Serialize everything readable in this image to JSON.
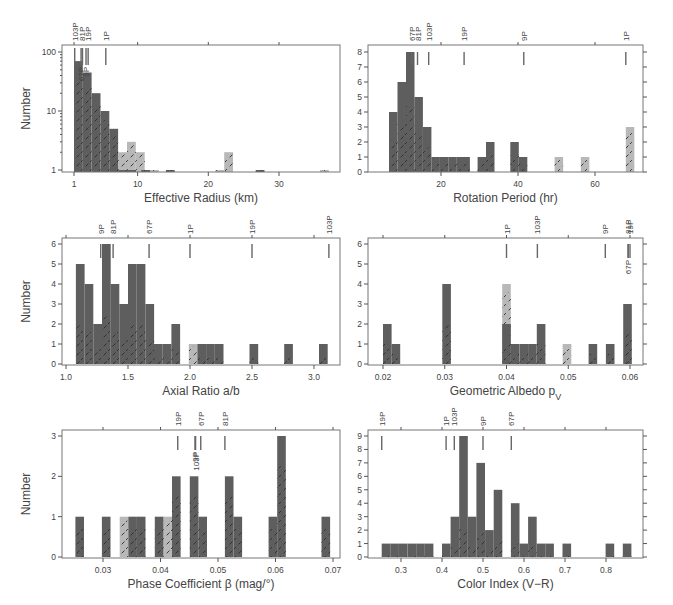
{
  "figure": {
    "ylabel": "Number",
    "colors": {
      "dark_bar": "#5e5e5e",
      "light_bar": "#b8b8b8",
      "hatch": "#333333",
      "axis": "#777777"
    }
  },
  "chart_data": [
    {
      "id": "effective-radius",
      "type": "bar",
      "title": "",
      "xlabel": "Effective Radius (km)",
      "ylabel": "Number",
      "yscale": "log",
      "ylim": [
        1,
        100
      ],
      "xlim": [
        0,
        38
      ],
      "xticks": [
        1,
        10,
        20,
        30
      ],
      "yticks": [
        1,
        10,
        100
      ],
      "bin_width": 1.25,
      "series": [
        {
          "name": "dark",
          "bins": [
            [
              1.0,
              70
            ],
            [
              2.25,
              45
            ],
            [
              3.5,
              20
            ],
            [
              4.75,
              10
            ],
            [
              6.0,
              5
            ],
            [
              7.25,
              1
            ],
            [
              8.5,
              1
            ],
            [
              10.5,
              1
            ],
            [
              14.0,
              1
            ],
            [
              26.7,
              1
            ]
          ]
        },
        {
          "name": "light",
          "bins": [
            [
              7.25,
              2
            ],
            [
              8.5,
              3
            ],
            [
              9.75,
              2
            ],
            [
              11.75,
              1
            ],
            [
              21.0,
              1
            ],
            [
              22.25,
              2
            ],
            [
              35.8,
              1
            ]
          ]
        }
      ],
      "comet_markers": [
        {
          "label": "103P",
          "x": 1.1
        },
        {
          "label": "67P",
          "x": 2.0
        },
        {
          "label": "81P",
          "x": 2.2
        },
        {
          "label": "9P",
          "x": 2.7
        },
        {
          "label": "19P",
          "x": 3.0
        },
        {
          "label": "1P",
          "x": 5.5
        }
      ]
    },
    {
      "id": "rotation-period",
      "type": "bar",
      "xlabel": "Rotation Period (hr)",
      "ylabel": "Number",
      "ylim": [
        0,
        8
      ],
      "xlim": [
        3,
        74
      ],
      "xticks": [
        20,
        40,
        60
      ],
      "yticks": [
        0,
        1,
        2,
        3,
        4,
        5,
        6,
        7,
        8
      ],
      "bin_width": 2.2,
      "series": [
        {
          "name": "dark",
          "bins": [
            [
              6.5,
              4
            ],
            [
              8.7,
              6
            ],
            [
              10.9,
              8
            ],
            [
              13.1,
              5
            ],
            [
              15.3,
              3
            ],
            [
              17.5,
              1
            ],
            [
              19.7,
              1
            ],
            [
              21.9,
              1
            ],
            [
              24.1,
              1
            ],
            [
              25.3,
              1
            ],
            [
              29.5,
              1
            ],
            [
              31.7,
              2
            ],
            [
              38.0,
              2
            ],
            [
              40.2,
              1
            ]
          ]
        },
        {
          "name": "light",
          "bins": [
            [
              49.5,
              1
            ],
            [
              56.3,
              1
            ],
            [
              68.0,
              3
            ]
          ]
        }
      ],
      "comet_markers": [
        {
          "label": "67P",
          "x": 12.4
        },
        {
          "label": "81P",
          "x": 13.9
        },
        {
          "label": "103P",
          "x": 16.8
        },
        {
          "label": "19P",
          "x": 26.0
        },
        {
          "label": "9P",
          "x": 41.5
        },
        {
          "label": "1P",
          "x": 68.0
        }
      ]
    },
    {
      "id": "axial-ratio",
      "type": "bar",
      "xlabel": "Axial Ratio a/b",
      "ylabel": "Number",
      "ylim": [
        0,
        6
      ],
      "xlim": [
        0.97,
        3.2
      ],
      "xticks": [
        1.0,
        1.5,
        2.0,
        2.5,
        3.0
      ],
      "yticks": [
        0,
        1,
        2,
        3,
        4,
        5,
        6
      ],
      "bin_width": 0.07,
      "series": [
        {
          "name": "dark",
          "bins": [
            [
              1.08,
              5
            ],
            [
              1.15,
              4
            ],
            [
              1.22,
              2
            ],
            [
              1.29,
              6
            ],
            [
              1.36,
              4
            ],
            [
              1.43,
              3
            ],
            [
              1.5,
              5
            ],
            [
              1.57,
              5
            ],
            [
              1.64,
              3
            ],
            [
              1.71,
              1
            ],
            [
              1.78,
              1
            ],
            [
              1.85,
              2
            ],
            [
              2.06,
              1
            ],
            [
              2.13,
              1
            ],
            [
              2.2,
              1
            ],
            [
              2.48,
              1
            ],
            [
              2.76,
              1
            ],
            [
              3.04,
              1
            ]
          ]
        },
        {
          "name": "light",
          "bins": [
            [
              1.99,
              1
            ]
          ]
        }
      ],
      "comet_markers": [
        {
          "label": "9P",
          "x": 1.28
        },
        {
          "label": "81P",
          "x": 1.38
        },
        {
          "label": "67P",
          "x": 1.67
        },
        {
          "label": "1P",
          "x": 2.0
        },
        {
          "label": "19P",
          "x": 2.5
        },
        {
          "label": "103P",
          "x": 3.12
        }
      ]
    },
    {
      "id": "geometric-albedo",
      "type": "bar",
      "xlabel": "Geometric Albedo p",
      "xlabel_subscript": "V",
      "ylabel": "Number",
      "ylim": [
        0,
        6
      ],
      "xlim": [
        0.0175,
        0.0615
      ],
      "xticks": [
        0.02,
        0.03,
        0.04,
        0.05,
        0.06
      ],
      "yticks": [
        0,
        1,
        2,
        3,
        4,
        5,
        6
      ],
      "bin_width": 0.0014,
      "series": [
        {
          "name": "dark",
          "bins": [
            [
              0.02,
              2
            ],
            [
              0.0214,
              1
            ],
            [
              0.0296,
              4
            ],
            [
              0.0393,
              2
            ],
            [
              0.0407,
              1
            ],
            [
              0.0421,
              1
            ],
            [
              0.0435,
              1
            ],
            [
              0.0449,
              2
            ],
            [
              0.0533,
              1
            ],
            [
              0.0561,
              1
            ],
            [
              0.0589,
              3
            ]
          ]
        },
        {
          "name": "light",
          "bins": [
            [
              0.0393,
              4
            ],
            [
              0.0491,
              1
            ]
          ]
        }
      ],
      "comet_markers": [
        {
          "label": "1P",
          "x": 0.04
        },
        {
          "label": "103P",
          "x": 0.045
        },
        {
          "label": "9P",
          "x": 0.056
        },
        {
          "label": "81P",
          "x": 0.0597
        },
        {
          "label": "67P",
          "x": 0.0597
        },
        {
          "label": "19P",
          "x": 0.06
        }
      ]
    },
    {
      "id": "phase-coefficient",
      "type": "bar",
      "xlabel": "Phase Coefficient β (mag/°)",
      "ylabel": "Number",
      "ylim": [
        0,
        3
      ],
      "xlim": [
        0.023,
        0.0705
      ],
      "xticks": [
        0.03,
        0.04,
        0.05,
        0.06,
        0.07
      ],
      "yticks": [
        0,
        1,
        2,
        3
      ],
      "bin_width": 0.0015,
      "series": [
        {
          "name": "dark",
          "bins": [
            [
              0.0252,
              1
            ],
            [
              0.0298,
              1
            ],
            [
              0.0344,
              1
            ],
            [
              0.0359,
              1
            ],
            [
              0.039,
              1
            ],
            [
              0.042,
              2
            ],
            [
              0.0451,
              2
            ],
            [
              0.0466,
              1
            ],
            [
              0.0512,
              2
            ],
            [
              0.0527,
              1
            ],
            [
              0.0588,
              1
            ],
            [
              0.0603,
              3
            ],
            [
              0.068,
              1
            ]
          ]
        },
        {
          "name": "light",
          "bins": [
            [
              0.0329,
              1
            ],
            [
              0.0405,
              1
            ]
          ]
        }
      ],
      "comet_markers": [
        {
          "label": "19P",
          "x": 0.043
        },
        {
          "label": "9P",
          "x": 0.046
        },
        {
          "label": "103P",
          "x": 0.0461
        },
        {
          "label": "67P",
          "x": 0.047
        },
        {
          "label": "81P",
          "x": 0.0512
        }
      ]
    },
    {
      "id": "color-index",
      "type": "bar",
      "xlabel": "Color Index (V−R)",
      "ylabel": "Number",
      "ylim": [
        0,
        9
      ],
      "xlim": [
        0.22,
        0.89
      ],
      "xticks": [
        0.3,
        0.4,
        0.5,
        0.6,
        0.7,
        0.8
      ],
      "yticks": [
        0,
        1,
        2,
        3,
        4,
        5,
        6,
        7,
        8,
        9
      ],
      "bin_width": 0.021,
      "series": [
        {
          "name": "dark",
          "bins": [
            [
              0.253,
              1
            ],
            [
              0.274,
              1
            ],
            [
              0.295,
              1
            ],
            [
              0.316,
              1
            ],
            [
              0.337,
              1
            ],
            [
              0.358,
              1
            ],
            [
              0.4,
              1
            ],
            [
              0.421,
              3
            ],
            [
              0.442,
              9
            ],
            [
              0.463,
              3
            ],
            [
              0.484,
              7
            ],
            [
              0.505,
              2
            ],
            [
              0.526,
              5
            ],
            [
              0.568,
              4
            ],
            [
              0.589,
              1
            ],
            [
              0.61,
              3
            ],
            [
              0.631,
              1
            ],
            [
              0.652,
              1
            ],
            [
              0.694,
              1
            ],
            [
              0.799,
              1
            ],
            [
              0.841,
              1
            ]
          ]
        }
      ],
      "comet_markers": [
        {
          "label": "19P",
          "x": 0.253
        },
        {
          "label": "1P",
          "x": 0.41
        },
        {
          "label": "103P",
          "x": 0.43
        },
        {
          "label": "9P",
          "x": 0.5
        },
        {
          "label": "67P",
          "x": 0.569
        }
      ]
    }
  ]
}
